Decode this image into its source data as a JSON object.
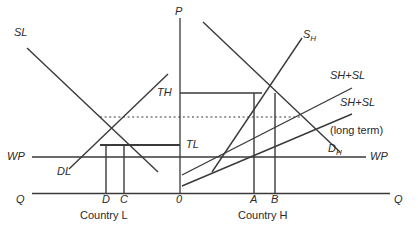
{
  "figure": {
    "kind": "economics-supply-demand-diagram",
    "axes": {
      "vertical_label": "P",
      "left_quantity_label": "Q",
      "right_quantity_label": "Q",
      "origin_label": "0"
    },
    "panels": [
      {
        "name": "Country L",
        "label": "Country L"
      },
      {
        "name": "Country H",
        "label": "Country H"
      }
    ],
    "curve_labels": {
      "sl": "SL",
      "dl": "DL",
      "sh_base": "S",
      "sh_sub": "H",
      "dh_base": "D",
      "dh_sub": "H",
      "sh_sl_1": "SH+SL",
      "sh_sl_2": "SH+SL",
      "long_term": "(long term)"
    },
    "price_labels": {
      "th": "TH",
      "tl": "TL",
      "wp_left": "WP",
      "wp_right": "WP"
    },
    "quantity_ticks": {
      "left": [
        "D",
        "C"
      ],
      "right": [
        "A",
        "B"
      ]
    },
    "colors": {
      "line": "#3a3a3a",
      "text": "#2a2a2a",
      "background": "#ffffff"
    }
  }
}
